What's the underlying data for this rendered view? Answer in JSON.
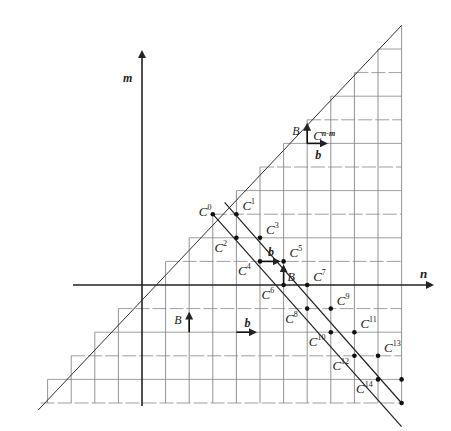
{
  "axes": {
    "x_label": "n",
    "y_label": "m"
  },
  "grid": {
    "n_min": -4,
    "n_max": 11,
    "m_min": -5,
    "m_max": 11,
    "region": "m <= n"
  },
  "diagonals": [
    {
      "name": "upper-diagonal",
      "from": [
        3,
        3
      ],
      "to": [
        11,
        -5
      ]
    },
    {
      "name": "lower-diagonal",
      "from": [
        3,
        3
      ],
      "to": [
        11,
        -6
      ]
    }
  ],
  "points": [
    {
      "label": "C",
      "sup": "0",
      "n": 3,
      "m": 3,
      "label_pos": "left"
    },
    {
      "label": "C",
      "sup": "1",
      "n": 4,
      "m": 3,
      "label_pos": "right"
    },
    {
      "label": "C",
      "sup": "2",
      "n": 4,
      "m": 2,
      "label_pos": "left-below"
    },
    {
      "label": "C",
      "sup": "3",
      "n": 5,
      "m": 2,
      "label_pos": "right"
    },
    {
      "label": "C",
      "sup": "4",
      "n": 5,
      "m": 1,
      "label_pos": "left-below"
    },
    {
      "label": "C",
      "sup": "5",
      "n": 6,
      "m": 1,
      "label_pos": "right"
    },
    {
      "label": "C",
      "sup": "6",
      "n": 6,
      "m": 0,
      "label_pos": "left-below"
    },
    {
      "label": "C",
      "sup": "7",
      "n": 7,
      "m": 0,
      "label_pos": "right"
    },
    {
      "label": "C",
      "sup": "8",
      "n": 7,
      "m": -1,
      "label_pos": "left-below"
    },
    {
      "label": "C",
      "sup": "9",
      "n": 8,
      "m": -1,
      "label_pos": "right"
    },
    {
      "label": "C",
      "sup": "10",
      "n": 8,
      "m": -2,
      "label_pos": "left-below"
    },
    {
      "label": "C",
      "sup": "11",
      "n": 9,
      "m": -2,
      "label_pos": "right"
    },
    {
      "label": "C",
      "sup": "12",
      "n": 9,
      "m": -3,
      "label_pos": "left-below"
    },
    {
      "label": "C",
      "sup": "13",
      "n": 10,
      "m": -3,
      "label_pos": "right"
    },
    {
      "label": "C",
      "sup": "14",
      "n": 10,
      "m": -4,
      "label_pos": "left-below"
    },
    {
      "label": "",
      "sup": "",
      "n": 11,
      "m": -4,
      "label_pos": "none"
    },
    {
      "label": "",
      "sup": "",
      "n": 11,
      "m": -5,
      "label_pos": "none"
    }
  ],
  "arrows": [
    {
      "label": "b",
      "n": 5,
      "m": 1,
      "dir": "right"
    },
    {
      "label": "B",
      "n": 6,
      "m": 0,
      "dir": "up"
    },
    {
      "label": "B",
      "n": 7,
      "m": 6,
      "dir": "up"
    },
    {
      "label": "b",
      "n": 7,
      "m": 6,
      "dir": "right"
    },
    {
      "label": "B",
      "n": 2,
      "m": -2,
      "dir": "up"
    },
    {
      "label": "b",
      "n": 4,
      "m": -2,
      "dir": "right"
    }
  ],
  "annotation": {
    "label": "C",
    "sup": "n-m",
    "n": 7,
    "m": 6
  }
}
